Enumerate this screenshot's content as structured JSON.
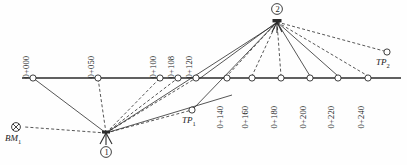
{
  "diagram": {
    "type": "survey-traverse",
    "colors": {
      "line": "#2b2b2b",
      "node_fill": "#ffffff",
      "text": "#1a1a1a"
    },
    "baseline": {
      "y": 78,
      "x_start": 22,
      "x_end": 401
    },
    "stations": [
      {
        "label": "0+000",
        "x": 33,
        "y": 78,
        "label_x": 30,
        "label_y": 70
      },
      {
        "label": "0+050",
        "x": 98,
        "y": 78,
        "label_x": 95,
        "label_y": 70
      },
      {
        "label": "0+100",
        "x": 160,
        "y": 78,
        "label_x": 157,
        "label_y": 70
      },
      {
        "label": "0+108",
        "x": 178,
        "y": 78,
        "label_x": 175,
        "label_y": 70
      },
      {
        "label": "0+120",
        "x": 196,
        "y": 78,
        "label_x": 193,
        "label_y": 70
      },
      {
        "label": "0+140",
        "x": 227,
        "y": 78,
        "label_x": 224,
        "label_y": 88
      },
      {
        "label": "0+160",
        "x": 252,
        "y": 78,
        "label_x": 249,
        "label_y": 88
      },
      {
        "label": "0+180",
        "x": 281,
        "y": 78,
        "label_x": 278,
        "label_y": 88
      },
      {
        "label": "0+200",
        "x": 310,
        "y": 78,
        "label_x": 307,
        "label_y": 88
      },
      {
        "label": "0+220",
        "x": 338,
        "y": 78,
        "label_x": 335,
        "label_y": 88
      },
      {
        "label": "0+240",
        "x": 368,
        "y": 78,
        "label_x": 365,
        "label_y": 88
      }
    ],
    "turning_points": [
      {
        "label": "TP",
        "sub": "1",
        "x": 192,
        "y": 110,
        "label_x": 185,
        "label_y": 122
      },
      {
        "label": "TP",
        "sub": "2",
        "x": 387,
        "y": 52,
        "label_x": 378,
        "label_y": 64
      }
    ],
    "benchmarks": [
      {
        "label": "BM",
        "sub": "1",
        "x": 16,
        "y": 127,
        "label_x": 6,
        "label_y": 140
      }
    ],
    "instrument_setups": [
      {
        "number": "1",
        "x": 106,
        "y": 133,
        "circle_x": 106,
        "circle_y": 152
      },
      {
        "number": "2",
        "x": 277,
        "y": 20,
        "circle_x": 277,
        "circle_y": 9
      }
    ],
    "sights_from_setup_1": [
      {
        "to": "0+000",
        "style": "solid"
      },
      {
        "to": "0+050",
        "style": "dashed"
      },
      {
        "to": "0+100",
        "style": "dashed"
      },
      {
        "to": "0+108",
        "style": "dashed"
      },
      {
        "to": "0+120",
        "style": "dashed"
      },
      {
        "to": "TP1",
        "style": "dashed"
      },
      {
        "to": "BM1",
        "style": "dashed"
      },
      {
        "to": "setup-2",
        "style": "solid"
      }
    ],
    "sights_from_setup_2": [
      {
        "to": "TP1",
        "style": "solid"
      },
      {
        "to": "0+120",
        "style": "solid"
      },
      {
        "to": "0+140",
        "style": "dashed"
      },
      {
        "to": "0+160",
        "style": "dashed"
      },
      {
        "to": "0+180",
        "style": "dashed"
      },
      {
        "to": "0+200",
        "style": "dashed"
      },
      {
        "to": "0+220",
        "style": "dashed"
      },
      {
        "to": "0+240",
        "style": "dashed"
      },
      {
        "to": "TP2",
        "style": "dashed"
      }
    ]
  }
}
